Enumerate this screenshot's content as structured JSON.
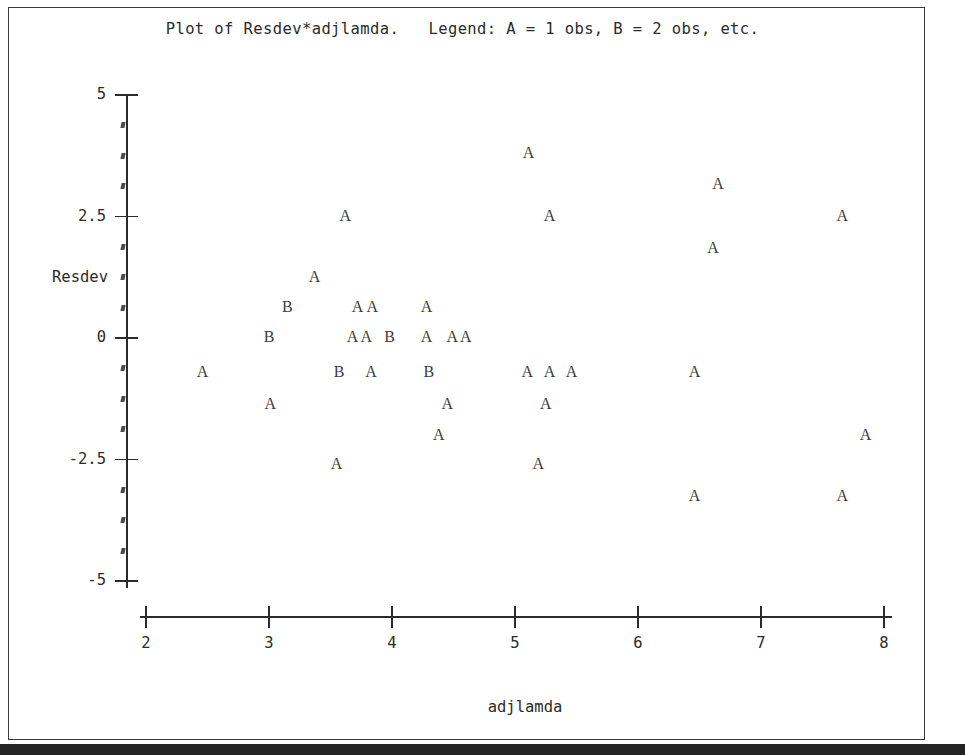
{
  "title": "Plot of Resdev*adjlamda.   Legend: A = 1 obs, B = 2 obs, etc.",
  "axis_label_x": "adjlamda",
  "axis_label_y": "Resdev",
  "chart_data": {
    "type": "scatter",
    "title": "Plot of Resdev*adjlamda.   Legend: A = 1 obs, B = 2 obs, etc.",
    "xlabel": "adjlamda",
    "ylabel": "Resdev",
    "xlim": [
      1.8,
      8.1
    ],
    "ylim": [
      -5.7,
      5.2
    ],
    "grid": false,
    "legend": "A = 1 obs, B = 2 obs, etc.",
    "legend_position": "title",
    "xticks": [
      2,
      3,
      4,
      5,
      6,
      7,
      8
    ],
    "xtick_labels": [
      "2",
      "3",
      "4",
      "5",
      "6",
      "7",
      "8"
    ],
    "yticks": [
      5,
      2.5,
      0,
      -2.5,
      -5
    ],
    "ytick_labels": [
      "5",
      "2.5",
      "0",
      "-2.5",
      "-5"
    ],
    "y_minor_ticks": [
      4.375,
      3.75,
      3.125,
      1.875,
      1.25,
      0.625,
      -0.625,
      -1.25,
      -1.875,
      -3.125,
      -3.75,
      -4.375
    ],
    "marker_meaning": {
      "A": 1,
      "B": 2
    },
    "points": [
      {
        "label": "A",
        "x": 5.11,
        "y": 3.81
      },
      {
        "label": "A",
        "x": 6.65,
        "y": 3.17
      },
      {
        "label": "A",
        "x": 3.62,
        "y": 2.51
      },
      {
        "label": "A",
        "x": 5.28,
        "y": 2.51
      },
      {
        "label": "A",
        "x": 7.66,
        "y": 2.51
      },
      {
        "label": "A",
        "x": 6.61,
        "y": 1.85
      },
      {
        "label": "A",
        "x": 3.37,
        "y": 1.25
      },
      {
        "label": "B",
        "x": 3.15,
        "y": 0.64
      },
      {
        "label": "A",
        "x": 3.72,
        "y": 0.64
      },
      {
        "label": "A",
        "x": 3.84,
        "y": 0.64
      },
      {
        "label": "A",
        "x": 4.28,
        "y": 0.64
      },
      {
        "label": "B",
        "x": 3.0,
        "y": 0.02
      },
      {
        "label": "A",
        "x": 3.68,
        "y": 0.02
      },
      {
        "label": "A",
        "x": 3.79,
        "y": 0.02
      },
      {
        "label": "B",
        "x": 3.98,
        "y": 0.02
      },
      {
        "label": "A",
        "x": 4.28,
        "y": 0.02
      },
      {
        "label": "A",
        "x": 4.49,
        "y": 0.02
      },
      {
        "label": "A",
        "x": 4.6,
        "y": 0.02
      },
      {
        "label": "A",
        "x": 2.46,
        "y": -0.7
      },
      {
        "label": "B",
        "x": 3.57,
        "y": -0.7
      },
      {
        "label": "A",
        "x": 3.83,
        "y": -0.7
      },
      {
        "label": "B",
        "x": 4.3,
        "y": -0.7
      },
      {
        "label": "A",
        "x": 5.1,
        "y": -0.7
      },
      {
        "label": "A",
        "x": 5.28,
        "y": -0.7
      },
      {
        "label": "A",
        "x": 5.46,
        "y": -0.7
      },
      {
        "label": "A",
        "x": 6.46,
        "y": -0.7
      },
      {
        "label": "A",
        "x": 3.01,
        "y": -1.36
      },
      {
        "label": "A",
        "x": 4.45,
        "y": -1.36
      },
      {
        "label": "A",
        "x": 5.25,
        "y": -1.36
      },
      {
        "label": "A",
        "x": 4.38,
        "y": -2.0
      },
      {
        "label": "A",
        "x": 7.85,
        "y": -2.0
      },
      {
        "label": "A",
        "x": 3.55,
        "y": -2.59
      },
      {
        "label": "A",
        "x": 5.19,
        "y": -2.59
      },
      {
        "label": "A",
        "x": 6.46,
        "y": -3.25
      },
      {
        "label": "A",
        "x": 7.66,
        "y": -3.25
      }
    ]
  }
}
